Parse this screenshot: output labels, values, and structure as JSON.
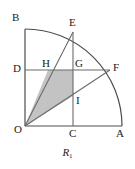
{
  "figure": {
    "caption_main": "R",
    "caption_sub": "1",
    "colors": {
      "stroke": "#4d4d4d",
      "stroke_dark": "#333333",
      "shade_fill": "#c3c3c3",
      "text": "#1a1a1a",
      "background": "#ffffff"
    },
    "points": [
      {
        "id": "B",
        "label": "B",
        "x": 25,
        "y": 29,
        "label_x": 12,
        "label_y": 12
      },
      {
        "id": "E",
        "label": "E",
        "x": 73,
        "y": 32,
        "label_x": 69,
        "label_y": 17
      },
      {
        "id": "D",
        "label": "D",
        "x": 25,
        "y": 70,
        "label_x": 13,
        "label_y": 63
      },
      {
        "id": "H",
        "label": "H",
        "x": 48,
        "y": 70,
        "label_x": 42,
        "label_y": 58
      },
      {
        "id": "G",
        "label": "G",
        "x": 73,
        "y": 70,
        "label_x": 75,
        "label_y": 58
      },
      {
        "id": "F",
        "label": "F",
        "x": 110,
        "y": 70,
        "label_x": 113,
        "label_y": 62
      },
      {
        "id": "I",
        "label": "I",
        "x": 73,
        "y": 96,
        "label_x": 76,
        "label_y": 95
      },
      {
        "id": "O",
        "label": "O",
        "x": 25,
        "y": 126,
        "label_x": 14,
        "label_y": 124
      },
      {
        "id": "C",
        "label": "C",
        "x": 73,
        "y": 126,
        "label_x": 69,
        "label_y": 128
      },
      {
        "id": "A",
        "label": "A",
        "x": 122,
        "y": 126,
        "label_x": 116,
        "label_y": 128
      }
    ],
    "segments": [
      {
        "name": "vertical-axis-OB",
        "x1": 25,
        "y1": 126,
        "x2": 25,
        "y2": 29
      },
      {
        "name": "horizontal-axis-OA",
        "x1": 25,
        "y1": 126,
        "x2": 122,
        "y2": 126
      },
      {
        "name": "chord-line-DF",
        "x1": 25,
        "y1": 70,
        "x2": 110,
        "y2": 70
      },
      {
        "name": "vertical-line-CE",
        "x1": 73,
        "y1": 126,
        "x2": 73,
        "y2": 32
      },
      {
        "name": "radius-OE",
        "x1": 25,
        "y1": 126,
        "x2": 73,
        "y2": 32
      },
      {
        "name": "radius-OF",
        "x1": 25,
        "y1": 126,
        "x2": 110,
        "y2": 70
      }
    ],
    "arc": {
      "name": "quarter-circle-arc-BEFA",
      "center_x": 25,
      "center_y": 126,
      "radius": 97,
      "path": "M 25 29 A 97 97 0 0 1 122 126"
    },
    "shaded_region": {
      "name": "shaded-quadrilateral-OHGI",
      "vertices": "25,126 48,70 73,70 73,96",
      "vertex_ids": [
        "O",
        "H",
        "G",
        "I"
      ]
    }
  }
}
